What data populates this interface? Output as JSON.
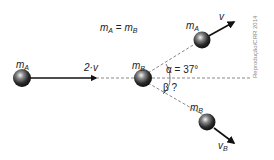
{
  "diagram": {
    "relation": {
      "left": "m",
      "left_sub": "A",
      "eq": " = ",
      "right": "m",
      "right_sub": "B"
    },
    "ball_A_initial": {
      "label": "m",
      "sub": "A"
    },
    "incoming_velocity": {
      "label": "2·v"
    },
    "ball_B_initial": {
      "label": "m",
      "sub": "B"
    },
    "ball_A_final": {
      "label": "m",
      "sub": "A",
      "velocity": "v"
    },
    "ball_B_final": {
      "label": "m",
      "sub": "B",
      "velocity": "v",
      "velocity_sub": "B"
    },
    "angle_alpha": {
      "label": "α = 37°"
    },
    "angle_beta": {
      "label": "β ?"
    },
    "credit": "Reprodução/CRR 2014",
    "colors": {
      "ball": "#2a2a2a",
      "line": "#111111",
      "dashed": "#888888",
      "text": "#222222"
    }
  }
}
